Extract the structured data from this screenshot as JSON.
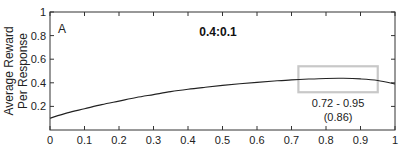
{
  "chart_data": {
    "type": "line",
    "panel_label": "A",
    "title": "0.4:0.1",
    "xlabel": "",
    "ylabel": [
      "Average Reward",
      "Per Response"
    ],
    "xlim": [
      0,
      1
    ],
    "ylim": [
      0,
      1
    ],
    "x_ticks": [
      "0",
      "0.1",
      "0.2",
      "0.3",
      "0.4",
      "0.5",
      "0.6",
      "0.7",
      "0.8",
      "0.9",
      "1"
    ],
    "y_ticks": [
      "0.2",
      "0.4",
      "0.6",
      "0.8",
      "1"
    ],
    "grid": false,
    "series": [
      {
        "name": "average reward per response",
        "x": [
          0,
          0.05,
          0.1,
          0.15,
          0.2,
          0.25,
          0.3,
          0.35,
          0.4,
          0.45,
          0.5,
          0.55,
          0.6,
          0.65,
          0.7,
          0.75,
          0.8,
          0.85,
          0.9,
          0.95,
          1.0
        ],
        "values": [
          0.1,
          0.145,
          0.18,
          0.215,
          0.245,
          0.275,
          0.3,
          0.325,
          0.345,
          0.362,
          0.378,
          0.392,
          0.404,
          0.415,
          0.425,
          0.432,
          0.437,
          0.438,
          0.433,
          0.42,
          0.39
        ]
      }
    ],
    "annotations": [
      {
        "type": "rectangle",
        "x_range": [
          0.72,
          0.95
        ],
        "y_range": [
          0.32,
          0.54
        ],
        "color": "#c8c8c8"
      },
      {
        "type": "text",
        "lines": [
          "0.72 - 0.95",
          "(0.86)"
        ]
      }
    ]
  },
  "colors": {
    "axis": "#333333",
    "curve": "#222222",
    "highlight_box": "#c8c8c8"
  }
}
